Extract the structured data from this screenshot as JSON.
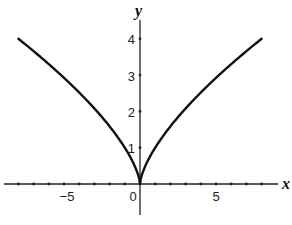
{
  "chart_data": {
    "type": "line",
    "title": "",
    "function": "y = x^(2/3)",
    "xlabel": "x",
    "ylabel": "y",
    "xlim": [
      -9,
      9.5
    ],
    "ylim": [
      -1,
      4.5
    ],
    "grid": false,
    "legend": null,
    "x_ticks": [
      -8,
      -7,
      -6,
      -5,
      -4,
      -3,
      -2,
      -1,
      0,
      1,
      2,
      3,
      4,
      5,
      6,
      7,
      8
    ],
    "x_tick_labels": [
      {
        "value": -5,
        "label": "−5"
      },
      {
        "value": 0,
        "label": "0"
      },
      {
        "value": 5,
        "label": "5"
      }
    ],
    "y_ticks": [
      1,
      2,
      3,
      4
    ],
    "y_tick_labels": [
      {
        "value": 1,
        "label": "1"
      },
      {
        "value": 2,
        "label": "2"
      },
      {
        "value": 3,
        "label": "3"
      },
      {
        "value": 4,
        "label": "4"
      }
    ],
    "series": [
      {
        "name": "y = x^(2/3)",
        "color": "#111111",
        "x": [
          -8,
          -7,
          -6,
          -5,
          -4,
          -3,
          -2,
          -1,
          -0.5,
          -0.1,
          0,
          0.1,
          0.5,
          1,
          2,
          3,
          4,
          5,
          6,
          7,
          8
        ],
        "y": [
          4,
          3.66,
          3.3,
          2.92,
          2.52,
          2.08,
          1.59,
          1,
          0.63,
          0.22,
          0,
          0.22,
          0.63,
          1,
          1.59,
          2.08,
          2.52,
          2.92,
          3.3,
          3.66,
          4
        ]
      }
    ]
  },
  "labels": {
    "x_axis": "x",
    "y_axis": "y",
    "x_neg5": "−5",
    "x_0": "0",
    "x_5": "5",
    "y_1": "1",
    "y_2": "2",
    "y_3": "3",
    "y_4": "4"
  }
}
